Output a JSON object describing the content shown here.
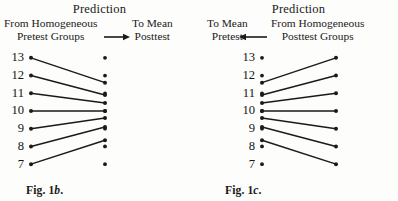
{
  "figure": {
    "background_color": "#fdfdfb",
    "ink_color": "#1a1a1a"
  },
  "panels": [
    {
      "id": "panel-left",
      "caption_prefix": "Fig. ",
      "caption_number": "1",
      "caption_letter": "b",
      "caption_suffix": ".",
      "caption_full": "Fig. 1b.",
      "title": "Prediction",
      "arrow_direction": "right",
      "arrow_icon": "arrow-right-icon",
      "source_header_line1": "From Homogeneous",
      "source_header_line2": "Pretest Groups",
      "target_header_line1": "To Mean",
      "target_header_line2": "Posttest",
      "axis_labels": [
        "13",
        "12",
        "11",
        "10",
        "9",
        "8",
        "7"
      ],
      "chart_data": {
        "type": "line",
        "title": "Prediction",
        "xlabel": "",
        "ylabel": "",
        "ylim": [
          6.5,
          13.5
        ],
        "grid": false,
        "legend": "none",
        "categories": [
          "From Homogeneous Pretest Groups",
          "To Mean Posttest"
        ],
        "series": [
          {
            "name": "13",
            "values": [
              13,
              11.6
            ],
            "connected": true
          },
          {
            "name": "12",
            "values": [
              12,
              10.9
            ],
            "connected": true
          },
          {
            "name": "11",
            "values": [
              11,
              10.45
            ],
            "connected": true
          },
          {
            "name": "10",
            "values": [
              10,
              10.0
            ],
            "connected": true
          },
          {
            "name": "9",
            "values": [
              9,
              9.6
            ],
            "connected": true
          },
          {
            "name": "8",
            "values": [
              8,
              9.1
            ],
            "connected": true
          },
          {
            "name": "7",
            "values": [
              7,
              8.35
            ],
            "connected": true
          }
        ],
        "extra_points": [
          {
            "x": 1,
            "y": 13
          },
          {
            "x": 1,
            "y": 12
          },
          {
            "x": 1,
            "y": 11
          },
          {
            "x": 1,
            "y": 10
          },
          {
            "x": 1,
            "y": 9
          },
          {
            "x": 1,
            "y": 8
          },
          {
            "x": 1,
            "y": 7
          }
        ]
      }
    },
    {
      "id": "panel-right",
      "caption_prefix": "Fig. ",
      "caption_number": "1",
      "caption_letter": "c",
      "caption_suffix": ".",
      "caption_full": "Fig. 1c.",
      "title": "Prediction",
      "arrow_direction": "left",
      "arrow_icon": "arrow-left-icon",
      "source_header_line1": "From Homogeneous",
      "source_header_line2": "Posttest Groups",
      "target_header_line1": "To Mean",
      "target_header_line2": "Pretest",
      "axis_labels": [
        "13",
        "12",
        "11",
        "10",
        "9",
        "8",
        "7"
      ],
      "chart_data": {
        "type": "line",
        "title": "Prediction",
        "xlabel": "",
        "ylabel": "",
        "ylim": [
          6.5,
          13.5
        ],
        "grid": false,
        "legend": "none",
        "categories": [
          "To Mean Pretest",
          "From Homogeneous Posttest Groups"
        ],
        "series": [
          {
            "name": "13",
            "values": [
              11.6,
              13
            ],
            "connected": true
          },
          {
            "name": "12",
            "values": [
              10.9,
              12
            ],
            "connected": true
          },
          {
            "name": "11",
            "values": [
              10.45,
              11
            ],
            "connected": true
          },
          {
            "name": "10",
            "values": [
              10.0,
              10
            ],
            "connected": true
          },
          {
            "name": "9",
            "values": [
              9.6,
              9
            ],
            "connected": true
          },
          {
            "name": "8",
            "values": [
              9.1,
              8
            ],
            "connected": true
          },
          {
            "name": "7",
            "values": [
              8.35,
              7
            ],
            "connected": true
          }
        ],
        "extra_points": [
          {
            "x": 0,
            "y": 13
          },
          {
            "x": 0,
            "y": 12
          },
          {
            "x": 0,
            "y": 11
          },
          {
            "x": 0,
            "y": 10
          },
          {
            "x": 0,
            "y": 9
          },
          {
            "x": 0,
            "y": 8
          },
          {
            "x": 0,
            "y": 7
          }
        ]
      }
    }
  ]
}
